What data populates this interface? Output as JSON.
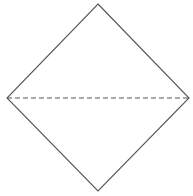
{
  "diagram": {
    "type": "diamond-with-horizontal-diagonal",
    "background": "#ffffff",
    "stroke_color": "#555555",
    "shape": {
      "vertices": {
        "top": [
          98,
          4
        ],
        "right": [
          189,
          98
        ],
        "bottom": [
          98,
          191
        ],
        "left": [
          7,
          98
        ]
      },
      "points": "98,4 189,98 98,191 7,98",
      "stroke_width": 1.1
    },
    "diagonal": {
      "x1": 7,
      "y1": 98,
      "x2": 189,
      "y2": 98,
      "style": "dashed",
      "dasharray": "5,3",
      "stroke_width": 1.1
    }
  }
}
